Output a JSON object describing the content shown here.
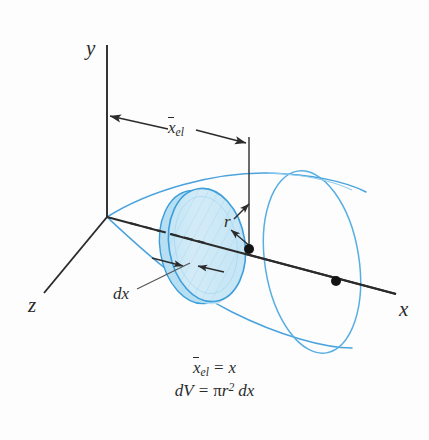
{
  "figure": {
    "title_caption": "",
    "axes": {
      "y_label": "y",
      "z_label": "z",
      "x_label": "x"
    },
    "annotations": {
      "dimension_label_base": "x",
      "dimension_label_sub": "el",
      "radius_label": "r",
      "thickness_label": "dx"
    },
    "equations": [
      {
        "id": "centroid",
        "lhs_base": "x",
        "lhs_sub": "el",
        "operator": "=",
        "rhs": "x"
      },
      {
        "id": "volume",
        "lhs": "dV",
        "operator": "=",
        "rhs_pi": "π",
        "rhs_r": "r",
        "rhs_exp": "2",
        "rhs_dx": "dx"
      }
    ],
    "colors": {
      "solid_outline": "#4ba3dd",
      "disk_fill": "#cfe9f6",
      "disk_edge": "#3d9ed9",
      "axis_line": "#2b2b2b",
      "text": "#2b2b2b",
      "background": "#fdfdfd"
    },
    "shape": {
      "type": "cone-frustum-volume-of-revolution",
      "elements": [
        "y-axis",
        "z-axis",
        "x-axis",
        "cone-surface",
        "disk-element",
        "end-circle",
        "centroid-dot",
        "element-center-dot",
        "radius-arrow",
        "thickness-arrows",
        "dimension-arrow"
      ]
    }
  }
}
